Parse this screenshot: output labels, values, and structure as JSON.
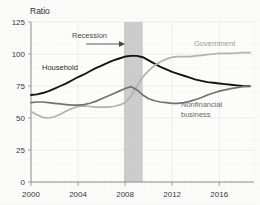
{
  "chart_data": {
    "type": "line",
    "title": "",
    "ylabel": "Ratio",
    "xlabel": "",
    "ylim": [
      0,
      125
    ],
    "xlim": [
      2000,
      2018.7
    ],
    "yticks": [
      0,
      25,
      50,
      75,
      100,
      125
    ],
    "ytick_labels": [
      "0",
      "25",
      "50",
      "75",
      "100",
      "125"
    ],
    "xticks": [
      2000,
      2004,
      2008,
      2012,
      2016
    ],
    "xtick_labels": [
      "2000",
      "2004",
      "2008",
      "2012",
      "2016"
    ],
    "grid": true,
    "legend_position": "inline-annotations",
    "annotations": [
      {
        "text": "Recession",
        "x": 2005.0,
        "y": 118,
        "type": "shaded-band-label"
      },
      {
        "text": "Household",
        "x": 2002.2,
        "y": 86,
        "type": "series-label"
      },
      {
        "text": "Government",
        "x": 2015.2,
        "y": 104,
        "type": "series-label"
      },
      {
        "text": "Nonfinancial business",
        "x": 2014.5,
        "y": 61,
        "type": "series-label"
      }
    ],
    "shaded_regions": [
      {
        "label": "Recession",
        "x_start": 2007.9,
        "x_end": 2009.5,
        "color": "#c4c4c4"
      }
    ],
    "series": [
      {
        "name": "Household",
        "color": "#141414",
        "x": [
          2000.0,
          2000.5,
          2001.0,
          2001.5,
          2002.0,
          2002.5,
          2003.0,
          2003.5,
          2004.0,
          2004.5,
          2005.0,
          2005.5,
          2006.0,
          2006.5,
          2007.0,
          2007.5,
          2008.0,
          2008.5,
          2009.0,
          2009.5,
          2010.0,
          2010.5,
          2011.0,
          2011.5,
          2012.0,
          2012.5,
          2013.0,
          2013.5,
          2014.0,
          2014.5,
          2015.0,
          2015.5,
          2016.0,
          2016.5,
          2017.0,
          2017.5,
          2018.0,
          2018.6
        ],
        "values": [
          68,
          68.5,
          69.5,
          71,
          73,
          75,
          77,
          79.5,
          82,
          84,
          86.5,
          89,
          91,
          93,
          95,
          96.5,
          98,
          98.5,
          98.5,
          97.5,
          95,
          92.5,
          90,
          88,
          86,
          84.5,
          83,
          81.5,
          80,
          79,
          78,
          77.5,
          77,
          76.5,
          76,
          75.5,
          75,
          74.8
        ]
      },
      {
        "name": "Government",
        "color": "#b2b2b2",
        "x": [
          2000.0,
          2000.5,
          2001.0,
          2001.5,
          2002.0,
          2002.5,
          2003.0,
          2003.5,
          2004.0,
          2004.5,
          2005.0,
          2005.5,
          2006.0,
          2006.5,
          2007.0,
          2007.5,
          2008.0,
          2008.5,
          2009.0,
          2009.5,
          2010.0,
          2010.5,
          2011.0,
          2011.5,
          2012.0,
          2012.5,
          2013.0,
          2013.5,
          2014.0,
          2014.5,
          2015.0,
          2015.5,
          2016.0,
          2016.5,
          2017.0,
          2017.5,
          2018.0,
          2018.6
        ],
        "values": [
          55,
          52.5,
          50.5,
          50,
          51,
          53,
          55.5,
          57.5,
          59,
          59.5,
          59,
          58.5,
          58.5,
          58.5,
          59,
          60,
          62,
          67,
          75,
          82,
          87,
          91,
          94,
          96,
          97.5,
          98,
          98,
          98,
          98.5,
          99,
          99.5,
          100,
          100.5,
          100.5,
          100.5,
          100.8,
          101,
          101
        ]
      },
      {
        "name": "Nonfinancial business",
        "color": "#737373",
        "x": [
          2000.0,
          2000.5,
          2001.0,
          2001.5,
          2002.0,
          2002.5,
          2003.0,
          2003.5,
          2004.0,
          2004.5,
          2005.0,
          2005.5,
          2006.0,
          2006.5,
          2007.0,
          2007.5,
          2008.0,
          2008.5,
          2009.0,
          2009.5,
          2010.0,
          2010.5,
          2011.0,
          2011.5,
          2012.0,
          2012.5,
          2013.0,
          2013.5,
          2014.0,
          2014.5,
          2015.0,
          2015.5,
          2016.0,
          2016.5,
          2017.0,
          2017.5,
          2018.0,
          2018.6
        ],
        "values": [
          62,
          62.5,
          62.5,
          62,
          61.5,
          61,
          60.5,
          60,
          60,
          60.5,
          61.5,
          63,
          65,
          67,
          69,
          71,
          73,
          74.5,
          72,
          68,
          65,
          63.5,
          62.5,
          62,
          61.5,
          61.5,
          62,
          63,
          64.5,
          66,
          68,
          69.5,
          71,
          72,
          73,
          73.8,
          74.5,
          74.8
        ]
      }
    ]
  }
}
